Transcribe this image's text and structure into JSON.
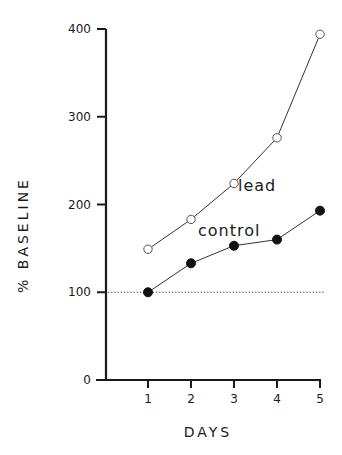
{
  "chart_data": {
    "type": "line",
    "title": "",
    "xlabel": "DAYS",
    "ylabel": "% BASELINE",
    "x": [
      1,
      2,
      3,
      4,
      5
    ],
    "x_ticks": [
      "1",
      "2",
      "3",
      "4",
      "5"
    ],
    "y_ticks": [
      "0",
      "100",
      "200",
      "300",
      "400"
    ],
    "ylim": [
      0,
      400
    ],
    "grid": false,
    "reference_line": {
      "y": 100,
      "style": "dotted"
    },
    "series": [
      {
        "name": "lead",
        "marker": "open-circle",
        "values": [
          149,
          183,
          224,
          276,
          394
        ]
      },
      {
        "name": "control",
        "marker": "filled-circle",
        "values": [
          100,
          133,
          153,
          160,
          193
        ]
      }
    ],
    "annotations": [
      {
        "text": "lead",
        "near": "series lead, day 3"
      },
      {
        "text": "control",
        "near": "series control, day 3"
      }
    ],
    "legend": "inline labels"
  },
  "labels": {
    "xlabel": "DAYS",
    "ylabel": "% BASELINE",
    "lead": "lead",
    "control": "control"
  }
}
